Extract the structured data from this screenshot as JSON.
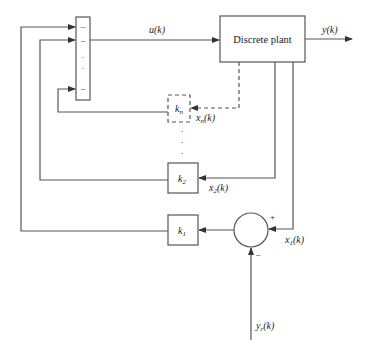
{
  "diagram": {
    "title": "",
    "type": "block-diagram",
    "blocks": {
      "plant": {
        "label": "Discrete plant"
      },
      "gain_n": {
        "label": "k",
        "subscript": "n",
        "style": "dashed"
      },
      "gain_2": {
        "label": "k",
        "subscript": "2"
      },
      "gain_1": {
        "label": "k",
        "subscript": "1"
      },
      "summing_bar": {
        "signs": [
          "–",
          "–",
          "·",
          "·",
          "–"
        ]
      },
      "summing_junction": {
        "plus_sign": "+",
        "minus_sign": "–"
      }
    },
    "signals": {
      "control": {
        "label": "u(k)",
        "main": "u",
        "arg": "(k)"
      },
      "output": {
        "label": "y(k)",
        "main": "y",
        "arg": "(k)"
      },
      "state_n": {
        "label": "x_n(k)",
        "main": "x",
        "sub": "n",
        "arg": "(k)"
      },
      "state_2": {
        "label": "x_2(k)",
        "main": "x",
        "sub": "2",
        "arg": "(k)"
      },
      "state_1": {
        "label": "x_1(k)",
        "main": "x",
        "sub": "1",
        "arg": "(k)"
      },
      "reference": {
        "label": "y_r(k)",
        "main": "y",
        "sub": "r",
        "arg": "(k)"
      }
    },
    "ellipsis": "·"
  }
}
